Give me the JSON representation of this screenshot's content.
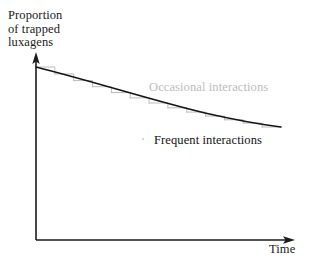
{
  "figure": {
    "background_color": "#ffffff",
    "width": 313,
    "height": 269
  },
  "axes": {
    "y_label_lines": [
      "Proportion",
      "of trapped",
      "luxagens"
    ],
    "y_label_full": "Proportion of trapped luxagens",
    "x_label": "Time",
    "axis_color": "#1a1a1a",
    "origin": {
      "x": 36,
      "y": 240
    },
    "y_axis_top": {
      "x": 36,
      "y": 53
    },
    "x_axis_end": {
      "x": 295,
      "y": 240
    },
    "has_ticks": false,
    "has_gridlines": false,
    "has_tick_labels": false
  },
  "labels": {
    "occasional": {
      "text": "Occasional interactions",
      "color": "#bcbcbc"
    },
    "frequent": {
      "text": "Frequent interactions",
      "color": "#111111"
    }
  },
  "chart_data": {
    "type": "line",
    "title": "",
    "subtitle": "",
    "xlabel": "Time",
    "ylabel": "Proportion of trapped luxagens",
    "xlim": [
      0,
      1
    ],
    "ylim": [
      0,
      1
    ],
    "grid": false,
    "legend": "inline-annotations",
    "axis_tick_labels": {
      "x": [],
      "y": []
    },
    "annotations": [
      {
        "text": "Occasional interactions",
        "x": 0.47,
        "y": 0.8,
        "color": "#bcbcbc"
      },
      {
        "text": "Frequent interactions",
        "x": 0.49,
        "y": 0.52,
        "color": "#111111"
      }
    ],
    "series": [
      {
        "name": "Frequent interactions",
        "style": "smooth-curve",
        "color": "#111111",
        "x": [
          0.0,
          0.08,
          0.17,
          0.25,
          0.33,
          0.41,
          0.5,
          0.58,
          0.66,
          0.74,
          0.82,
          0.9,
          1.0
        ],
        "y": [
          1.0,
          0.955,
          0.912,
          0.872,
          0.834,
          0.799,
          0.766,
          0.735,
          0.707,
          0.681,
          0.657,
          0.635,
          0.61
        ]
      },
      {
        "name": "Occasional interactions",
        "style": "step-staircase",
        "color": "#bcbcbc",
        "step_count": 13,
        "x": [
          0.0,
          0.08,
          0.17,
          0.25,
          0.33,
          0.41,
          0.5,
          0.58,
          0.66,
          0.74,
          0.82,
          0.9,
          1.0
        ],
        "y": [
          1.0,
          0.955,
          0.912,
          0.872,
          0.834,
          0.799,
          0.766,
          0.735,
          0.707,
          0.681,
          0.657,
          0.635,
          0.61
        ]
      }
    ]
  },
  "geometry": {
    "curve_start_px": {
      "x": 36,
      "y": 67
    },
    "curve_end_px": {
      "x": 281,
      "y": 127
    },
    "step_width_px": 19,
    "step_count": 13
  }
}
